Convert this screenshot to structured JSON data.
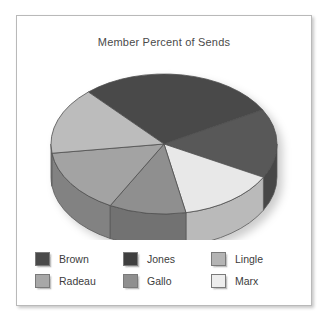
{
  "chart_data": {
    "type": "pie",
    "title": "Member Percent of Sends",
    "xlabel": "",
    "ylabel": "",
    "legend_position": "bottom",
    "three_d": true,
    "categories": [
      "Brown",
      "Jones",
      "Lingle",
      "Radeau",
      "Gallo",
      "Marx"
    ],
    "values": [
      28,
      16,
      16,
      15,
      11,
      14
    ],
    "slices": [
      {
        "label": "Brown",
        "value": 28,
        "color": "#4a4a4a",
        "start_angle": 318,
        "end_angle": 60.8
      },
      {
        "label": "Jones",
        "value": 16,
        "color": "#585858",
        "start_angle": 60.8,
        "end_angle": 118.4
      },
      {
        "label": "Marx",
        "value": 14,
        "color": "#e8e8e8",
        "start_angle": 118.4,
        "end_angle": 168.8
      },
      {
        "label": "Gallo",
        "value": 11,
        "color": "#8f8f8f",
        "start_angle": 168.8,
        "end_angle": 208.4
      },
      {
        "label": "Radeau",
        "value": 15,
        "color": "#a3a3a3",
        "start_angle": 208.4,
        "end_angle": 262.4
      },
      {
        "label": "Lingle",
        "value": 16,
        "color": "#bcbcbc",
        "start_angle": 262.4,
        "end_angle": 318
      }
    ],
    "colors": {
      "Brown": "#4a4a4a",
      "Jones": "#585858",
      "Lingle": "#bcbcbc",
      "Radeau": "#a3a3a3",
      "Gallo": "#8f8f8f",
      "Marx": "#e8e8e8"
    }
  },
  "chart": {
    "title": "Member Percent of Sends",
    "border_color": "#b9b9b9",
    "background": "#ffffff"
  },
  "legend": {
    "items": [
      {
        "label": "Brown",
        "color": "#4a4a4a"
      },
      {
        "label": "Jones",
        "color": "#3f3f3f"
      },
      {
        "label": "Lingle",
        "color": "#b4b4b4"
      },
      {
        "label": "Radeau",
        "color": "#a8a8a8"
      },
      {
        "label": "Gallo",
        "color": "#8f8f8f"
      },
      {
        "label": "Marx",
        "color": "#ededed"
      }
    ]
  }
}
